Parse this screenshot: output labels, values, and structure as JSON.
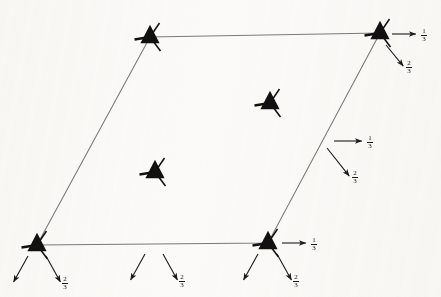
{
  "figure": {
    "kind": "crystallographic-space-group-diagram",
    "background_color": "#fbfaf8",
    "ink_color": "#111111",
    "cell_line_color": "#7a7a7a",
    "arrow_color": "#1a1a1a",
    "canvas": {
      "width": 441,
      "height": 297
    },
    "unit_cell": {
      "name": "unit-cell-parallelogram",
      "corners": [
        {
          "label": "top-left",
          "x": 150,
          "y": 37
        },
        {
          "label": "top-right",
          "x": 380,
          "y": 33
        },
        {
          "label": "bottom-right",
          "x": 268,
          "y": 243
        },
        {
          "label": "bottom-left",
          "x": 37,
          "y": 245
        }
      ]
    },
    "axis_symbols": [
      {
        "name": "threefold-axis-top-left",
        "x": 150,
        "y": 37,
        "rotation": 0
      },
      {
        "name": "threefold-axis-top-right",
        "x": 380,
        "y": 33,
        "rotation": 0
      },
      {
        "name": "threefold-axis-bottom-left",
        "x": 37,
        "y": 245,
        "rotation": 0
      },
      {
        "name": "threefold-axis-bottom-right",
        "x": 268,
        "y": 243,
        "rotation": 0
      },
      {
        "name": "threefold-axis-interior-upper",
        "x": 270,
        "y": 103,
        "rotation": 0
      },
      {
        "name": "threefold-axis-interior-lower",
        "x": 155,
        "y": 172,
        "rotation": 0
      }
    ],
    "arrow_groups": [
      {
        "name": "arrow-group-top-right",
        "arrows": [
          {
            "name": "screw-arrow-horizontal",
            "x1": 392,
            "y1": 34,
            "x2": 417,
            "y2": 34,
            "label": "1/3",
            "label_num": "1",
            "label_den": "3",
            "label_x": 421,
            "label_y": 28
          },
          {
            "name": "screw-arrow-diagonal",
            "x1": 386,
            "y1": 45,
            "x2": 404,
            "y2": 67,
            "label": "2/3",
            "label_num": "2",
            "label_den": "3",
            "label_x": 406,
            "label_y": 63
          }
        ]
      },
      {
        "name": "arrow-group-right-middle",
        "arrows": [
          {
            "name": "screw-arrow-horizontal",
            "x1": 334,
            "y1": 141,
            "x2": 363,
            "y2": 141,
            "label": "1/3",
            "label_num": "1",
            "label_den": "3",
            "label_x": 367,
            "label_y": 135
          },
          {
            "name": "screw-arrow-diagonal",
            "x1": 327,
            "y1": 148,
            "x2": 350,
            "y2": 177,
            "label": "2/3",
            "label_num": "2",
            "label_den": "3",
            "label_x": 352,
            "label_y": 173
          }
        ]
      },
      {
        "name": "arrow-group-bottom-right-node",
        "arrows": [
          {
            "name": "screw-arrow-horizontal",
            "x1": 282,
            "y1": 243,
            "x2": 307,
            "y2": 243,
            "label": "1/3",
            "label_num": "1",
            "label_den": "3",
            "label_x": 311,
            "label_y": 237
          },
          {
            "name": "screw-arrow-down-left",
            "x1": 258,
            "y1": 254,
            "x2": 243,
            "y2": 281,
            "label": "",
            "label_num": "",
            "label_den": "",
            "label_x": 0,
            "label_y": 0
          },
          {
            "name": "screw-arrow-down-right",
            "x1": 277,
            "y1": 254,
            "x2": 292,
            "y2": 281,
            "label": "2/3",
            "label_num": "2",
            "label_den": "3",
            "label_x": 292,
            "label_y": 277
          }
        ]
      },
      {
        "name": "arrow-group-bottom-left-node",
        "arrows": [
          {
            "name": "screw-arrow-down-left",
            "x1": 28,
            "y1": 256,
            "x2": 13,
            "y2": 283,
            "label": "",
            "label_num": "",
            "label_den": "",
            "label_x": 0,
            "label_y": 0
          },
          {
            "name": "screw-arrow-down-right",
            "x1": 46,
            "y1": 256,
            "x2": 61,
            "y2": 283,
            "label": "2/3",
            "label_num": "2",
            "label_den": "3",
            "label_x": 61,
            "label_y": 279
          }
        ]
      },
      {
        "name": "arrow-group-bottom-middle",
        "arrows": [
          {
            "name": "screw-arrow-down-left",
            "x1": 145,
            "y1": 254,
            "x2": 130,
            "y2": 281,
            "label": "",
            "label_num": "",
            "label_den": "",
            "label_x": 0,
            "label_y": 0
          },
          {
            "name": "screw-arrow-down-right",
            "x1": 163,
            "y1": 254,
            "x2": 178,
            "y2": 281,
            "label": "2/3",
            "label_num": "2",
            "label_den": "3",
            "label_x": 178,
            "label_y": 277
          }
        ]
      }
    ],
    "labels": [
      {
        "name": "fraction-label",
        "text": "1/3"
      },
      {
        "name": "fraction-label",
        "text": "2/3"
      }
    ]
  }
}
